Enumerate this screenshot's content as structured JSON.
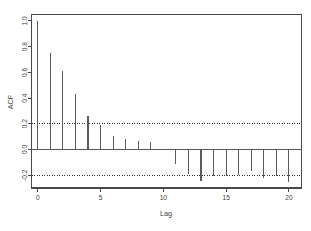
{
  "chart_data": {
    "type": "bar",
    "title": "",
    "xlabel": "Lag",
    "ylabel": "ACF",
    "categories": [
      0,
      1,
      2,
      3,
      4,
      5,
      6,
      7,
      8,
      9,
      10,
      11,
      12,
      13,
      14,
      15,
      16,
      17,
      18,
      19,
      20
    ],
    "values": [
      1.0,
      0.75,
      0.61,
      0.43,
      0.26,
      0.19,
      0.105,
      0.085,
      0.065,
      0.055,
      0.005,
      -0.11,
      -0.19,
      -0.245,
      -0.205,
      -0.21,
      -0.195,
      -0.17,
      -0.225,
      -0.205,
      -0.255
    ],
    "series": [
      {
        "name": "ACF",
        "values": [
          1.0,
          0.75,
          0.61,
          0.43,
          0.26,
          0.19,
          0.105,
          0.085,
          0.065,
          0.055,
          0.005,
          -0.11,
          -0.19,
          -0.245,
          -0.205,
          -0.21,
          -0.195,
          -0.17,
          -0.225,
          -0.205,
          -0.255
        ]
      }
    ],
    "xlim": [
      -0.5,
      21
    ],
    "ylim": [
      -0.3,
      1.05
    ],
    "xticks": [
      0,
      5,
      10,
      15,
      20
    ],
    "xtick_labels": [
      "0",
      "5",
      "10",
      "15",
      "20"
    ],
    "yticks": [
      -0.2,
      0.0,
      0.2,
      0.4,
      0.6,
      0.8,
      1.0
    ],
    "ytick_labels": [
      "-0.2",
      "0.0",
      "0.2",
      "0.4",
      "0.6",
      "0.8",
      "1.0"
    ],
    "grid": false,
    "legend": "none",
    "annotations": [
      {
        "name": "confidence-upper",
        "value": 0.2,
        "style": "dotted"
      },
      {
        "name": "confidence-lower",
        "value": -0.2,
        "style": "dotted"
      },
      {
        "name": "zero-line",
        "value": 0.0,
        "style": "solid"
      }
    ],
    "colors": {
      "bar": "#5a5a5a",
      "axis": "#4a4a4a",
      "confidence": "#2b2b2b",
      "background": "#ffffff",
      "text": "#3d3d3d"
    }
  },
  "axes": {
    "y_title": "ACF",
    "x_title": "Lag"
  }
}
